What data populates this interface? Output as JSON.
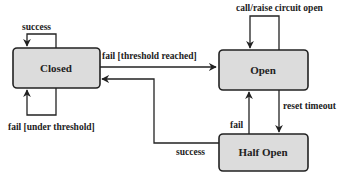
{
  "diagram": {
    "type": "state-machine",
    "states": [
      {
        "id": "closed",
        "label": "Closed"
      },
      {
        "id": "open",
        "label": "Open"
      },
      {
        "id": "half_open",
        "label": "Half Open"
      }
    ],
    "transitions": [
      {
        "from": "closed",
        "to": "closed",
        "label": "success"
      },
      {
        "from": "closed",
        "to": "closed",
        "label": "fail [under threshold]"
      },
      {
        "from": "closed",
        "to": "open",
        "label": "fail [threshold reached]"
      },
      {
        "from": "open",
        "to": "open",
        "label": "call/raise circuit open"
      },
      {
        "from": "open",
        "to": "half_open",
        "label": "reset timeout"
      },
      {
        "from": "half_open",
        "to": "open",
        "label": "fail"
      },
      {
        "from": "half_open",
        "to": "closed",
        "label": "success"
      }
    ],
    "colors": {
      "box_fill": "#dcdcdc",
      "stroke": "#222222"
    }
  }
}
